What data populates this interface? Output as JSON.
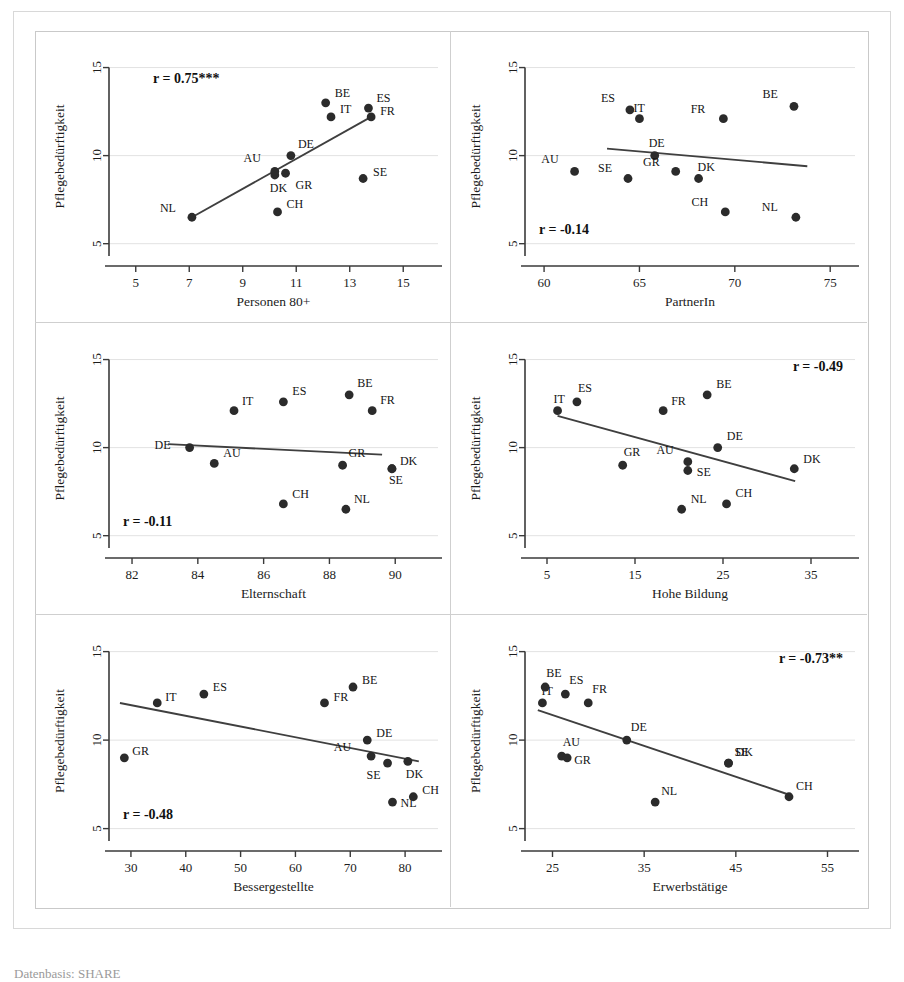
{
  "figure": {
    "y_axis_label": "Pflegebedürftigkeit",
    "y_ticks": [
      "5",
      "10",
      "15"
    ],
    "caption": "Datenbasis: SHARE"
  },
  "chart_data": [
    {
      "type": "scatter",
      "panel": 1,
      "title": "",
      "xlabel": "Personen 80+",
      "ylabel": "Pflegebedürftigkeit",
      "annotation": "r = 0.75***",
      "correlation": 0.75,
      "significance": "***",
      "xlim": [
        4.0,
        16.3
      ],
      "ylim": [
        4.3,
        15.6
      ],
      "xticks": [
        5,
        7,
        9,
        11,
        13,
        15
      ],
      "xticklabels": [
        "5",
        "7",
        "9",
        "11",
        "13",
        "15"
      ],
      "yticks": [
        5,
        10,
        15
      ],
      "yticklabels": [
        "5",
        "10",
        "15"
      ],
      "grid": true,
      "legend": "none",
      "points": [
        {
          "label": "NL",
          "x": 7.1,
          "y": 6.5,
          "lx": -16,
          "ly": -5
        },
        {
          "label": "CH",
          "x": 10.3,
          "y": 6.8,
          "lx": 9,
          "ly": -4
        },
        {
          "label": "DK",
          "x": 10.2,
          "y": 8.9,
          "lx": -5,
          "ly": 17
        },
        {
          "label": "AU",
          "x": 10.2,
          "y": 9.1,
          "lx": -14,
          "ly": -9
        },
        {
          "label": "GR",
          "x": 10.6,
          "y": 9.0,
          "lx": 10,
          "ly": 16
        },
        {
          "label": "DE",
          "x": 10.8,
          "y": 10.0,
          "lx": 7,
          "ly": -8
        },
        {
          "label": "SE",
          "x": 13.5,
          "y": 8.7,
          "lx": 10,
          "ly": -3
        },
        {
          "label": "IT",
          "x": 12.3,
          "y": 12.2,
          "lx": 9,
          "ly": -4
        },
        {
          "label": "BE",
          "x": 12.1,
          "y": 13.0,
          "lx": 9,
          "ly": -6
        },
        {
          "label": "ES",
          "x": 13.7,
          "y": 12.7,
          "lx": 8,
          "ly": -6
        },
        {
          "label": "FR",
          "x": 13.8,
          "y": 12.2,
          "lx": 9,
          "ly": -2
        }
      ],
      "fit": {
        "x1": 7.1,
        "y1": 6.5,
        "x2": 13.8,
        "y2": 12.2
      }
    },
    {
      "type": "scatter",
      "panel": 2,
      "title": "",
      "xlabel": "PartnerIn",
      "ylabel": "Pflegebedürftigkeit",
      "annotation": "r = -0.14",
      "correlation": -0.14,
      "significance": "",
      "xlim": [
        59.0,
        76.3
      ],
      "ylim": [
        4.3,
        15.6
      ],
      "xticks": [
        60,
        65,
        70,
        75
      ],
      "xticklabels": [
        "60",
        "65",
        "70",
        "75"
      ],
      "yticks": [
        5,
        10,
        15
      ],
      "yticklabels": [
        "5",
        "10",
        "15"
      ],
      "grid": true,
      "legend": "none",
      "points": [
        {
          "label": "AU",
          "x": 61.6,
          "y": 9.1,
          "lx": -16,
          "ly": -8
        },
        {
          "label": "SE",
          "x": 64.4,
          "y": 8.7,
          "lx": -16,
          "ly": -7
        },
        {
          "label": "ES",
          "x": 64.5,
          "y": 12.6,
          "lx": -15,
          "ly": -8
        },
        {
          "label": "IT",
          "x": 65.0,
          "y": 12.1,
          "lx": -6,
          "ly": -7
        },
        {
          "label": "DE",
          "x": 65.8,
          "y": 10.0,
          "lx": -6,
          "ly": -9
        },
        {
          "label": "GR",
          "x": 66.9,
          "y": 9.1,
          "lx": -16,
          "ly": -5
        },
        {
          "label": "DK",
          "x": 68.1,
          "y": 8.7,
          "lx": -1,
          "ly": -8
        },
        {
          "label": "CH",
          "x": 69.5,
          "y": 6.8,
          "lx": -17,
          "ly": -6
        },
        {
          "label": "FR",
          "x": 69.4,
          "y": 12.1,
          "lx": -18,
          "ly": -6
        },
        {
          "label": "BE",
          "x": 73.1,
          "y": 12.8,
          "lx": -16,
          "ly": -8
        },
        {
          "label": "NL",
          "x": 73.2,
          "y": 6.5,
          "lx": -18,
          "ly": -6
        }
      ],
      "fit": {
        "x1": 63.3,
        "y1": 10.4,
        "x2": 73.8,
        "y2": 9.4
      }
    },
    {
      "type": "scatter",
      "panel": 3,
      "title": "",
      "xlabel": "Elternschaft",
      "ylabel": "Pflegebedürftigkeit",
      "annotation": "r = -0.11",
      "correlation": -0.11,
      "significance": "",
      "xlim": [
        81.3,
        91.3
      ],
      "ylim": [
        4.3,
        15.6
      ],
      "xticks": [
        82,
        84,
        86,
        88,
        90
      ],
      "xticklabels": [
        "82",
        "84",
        "86",
        "88",
        "90"
      ],
      "yticks": [
        5,
        10,
        15
      ],
      "yticklabels": [
        "5",
        "10",
        "15"
      ],
      "grid": true,
      "legend": "none",
      "points": [
        {
          "label": "DE",
          "x": 83.75,
          "y": 10.0,
          "lx": -19,
          "ly": 1
        },
        {
          "label": "AU",
          "x": 84.5,
          "y": 9.1,
          "lx": 9,
          "ly": -6
        },
        {
          "label": "IT",
          "x": 85.1,
          "y": 12.1,
          "lx": 8,
          "ly": -6
        },
        {
          "label": "ES",
          "x": 86.6,
          "y": 12.6,
          "lx": 9,
          "ly": -7
        },
        {
          "label": "CH",
          "x": 86.6,
          "y": 6.8,
          "lx": 9,
          "ly": -6
        },
        {
          "label": "BE",
          "x": 88.6,
          "y": 13.0,
          "lx": 8,
          "ly": -8
        },
        {
          "label": "GR",
          "x": 88.4,
          "y": 9.0,
          "lx": 6,
          "ly": -8
        },
        {
          "label": "NL",
          "x": 88.5,
          "y": 6.5,
          "lx": 8,
          "ly": -6
        },
        {
          "label": "FR",
          "x": 89.3,
          "y": 12.1,
          "lx": 8,
          "ly": -7
        },
        {
          "label": "DK",
          "x": 89.9,
          "y": 8.8,
          "lx": 8,
          "ly": -4
        },
        {
          "label": "SE",
          "x": 89.9,
          "y": 8.8,
          "lx": -3,
          "ly": 15
        }
      ],
      "fit": {
        "x1": 83.1,
        "y1": 10.2,
        "x2": 89.6,
        "y2": 9.6
      }
    },
    {
      "type": "scatter",
      "panel": 4,
      "title": "",
      "xlabel": "Hohe Bildung",
      "ylabel": "Pflegebedürftigkeit",
      "annotation": "r = -0.49",
      "correlation": -0.49,
      "significance": "",
      "xlim": [
        2.5,
        40.0
      ],
      "ylim": [
        4.3,
        15.6
      ],
      "xticks": [
        5,
        15,
        25,
        35
      ],
      "xticklabels": [
        "5",
        "15",
        "25",
        "35"
      ],
      "yticks": [
        5,
        10,
        15
      ],
      "yticklabels": [
        "5",
        "10",
        "15"
      ],
      "grid": true,
      "legend": "none",
      "points": [
        {
          "label": "IT",
          "x": 6.2,
          "y": 12.1,
          "lx": -4,
          "ly": -8
        },
        {
          "label": "ES",
          "x": 8.4,
          "y": 12.6,
          "lx": 1,
          "ly": -10
        },
        {
          "label": "GR",
          "x": 13.6,
          "y": 9.0,
          "lx": 1,
          "ly": -9
        },
        {
          "label": "FR",
          "x": 18.2,
          "y": 12.1,
          "lx": 8,
          "ly": -6
        },
        {
          "label": "AU",
          "x": 21.0,
          "y": 9.2,
          "lx": -14,
          "ly": -8
        },
        {
          "label": "SE",
          "x": 21.0,
          "y": 8.7,
          "lx": 9,
          "ly": 5
        },
        {
          "label": "NL",
          "x": 20.3,
          "y": 6.5,
          "lx": 9,
          "ly": -6
        },
        {
          "label": "BE",
          "x": 23.2,
          "y": 13.0,
          "lx": 9,
          "ly": -7
        },
        {
          "label": "DE",
          "x": 24.4,
          "y": 10.0,
          "lx": 9,
          "ly": -8
        },
        {
          "label": "CH",
          "x": 25.4,
          "y": 6.8,
          "lx": 9,
          "ly": -7
        },
        {
          "label": "DK",
          "x": 33.1,
          "y": 8.8,
          "lx": 9,
          "ly": -6
        }
      ],
      "fit": {
        "x1": 6.2,
        "y1": 11.8,
        "x2": 33.2,
        "y2": 8.1
      }
    },
    {
      "type": "scatter",
      "panel": 5,
      "title": "",
      "xlabel": "Bessergestellte",
      "ylabel": "Pflegebedürftigkeit",
      "annotation": "r = -0.48",
      "correlation": -0.48,
      "significance": "",
      "xlim": [
        26.0,
        86.0
      ],
      "ylim": [
        4.3,
        15.6
      ],
      "xticks": [
        30,
        40,
        50,
        60,
        70,
        80
      ],
      "xticklabels": [
        "30",
        "40",
        "50",
        "60",
        "70",
        "80"
      ],
      "yticks": [
        5,
        10,
        15
      ],
      "yticklabels": [
        "5",
        "10",
        "15"
      ],
      "grid": true,
      "legend": "none",
      "points": [
        {
          "label": "GR",
          "x": 28.8,
          "y": 9.0,
          "lx": 8,
          "ly": -3
        },
        {
          "label": "IT",
          "x": 34.8,
          "y": 12.1,
          "lx": 8,
          "ly": -2
        },
        {
          "label": "ES",
          "x": 43.3,
          "y": 12.6,
          "lx": 9,
          "ly": -3
        },
        {
          "label": "FR",
          "x": 65.3,
          "y": 12.1,
          "lx": 9,
          "ly": -2
        },
        {
          "label": "BE",
          "x": 70.5,
          "y": 13.0,
          "lx": 9,
          "ly": -3
        },
        {
          "label": "DE",
          "x": 73.1,
          "y": 10.0,
          "lx": 9,
          "ly": -3
        },
        {
          "label": "AU",
          "x": 73.8,
          "y": 9.1,
          "lx": -20,
          "ly": -5
        },
        {
          "label": "SE",
          "x": 76.8,
          "y": 8.7,
          "lx": -7,
          "ly": 16
        },
        {
          "label": "DK",
          "x": 80.5,
          "y": 8.8,
          "lx": -2,
          "ly": 17
        },
        {
          "label": "NL",
          "x": 77.7,
          "y": 6.5,
          "lx": 8,
          "ly": 5
        },
        {
          "label": "CH",
          "x": 81.5,
          "y": 6.8,
          "lx": 9,
          "ly": -3
        }
      ],
      "fit": {
        "x1": 28.0,
        "y1": 12.1,
        "x2": 82.5,
        "y2": 8.8
      }
    },
    {
      "type": "scatter",
      "panel": 6,
      "title": "",
      "xlabel": "Erwerbstätige",
      "ylabel": "Pflegebedürftigkeit",
      "annotation": "r = -0.73**",
      "correlation": -0.73,
      "significance": "**",
      "xlim": [
        22.0,
        58.0
      ],
      "ylim": [
        4.3,
        15.6
      ],
      "xticks": [
        25,
        35,
        45,
        55
      ],
      "xticklabels": [
        "25",
        "35",
        "45",
        "55"
      ],
      "yticks": [
        5,
        10,
        15
      ],
      "yticklabels": [
        "5",
        "10",
        "15"
      ],
      "grid": true,
      "legend": "none",
      "points": [
        {
          "label": "IT",
          "x": 23.9,
          "y": 12.1,
          "lx": -1,
          "ly": -8
        },
        {
          "label": "BE",
          "x": 24.2,
          "y": 13.0,
          "lx": 1,
          "ly": -10
        },
        {
          "label": "ES",
          "x": 26.4,
          "y": 12.6,
          "lx": 4,
          "ly": -10
        },
        {
          "label": "FR",
          "x": 28.9,
          "y": 12.1,
          "lx": 4,
          "ly": -10
        },
        {
          "label": "AU",
          "x": 26.0,
          "y": 9.1,
          "lx": 1,
          "ly": -10
        },
        {
          "label": "GR",
          "x": 26.6,
          "y": 9.0,
          "lx": 7,
          "ly": 6
        },
        {
          "label": "DE",
          "x": 33.1,
          "y": 10.0,
          "lx": 4,
          "ly": -9
        },
        {
          "label": "NL",
          "x": 36.2,
          "y": 6.5,
          "lx": 6,
          "ly": -7
        },
        {
          "label": "SE",
          "x": 44.2,
          "y": 8.7,
          "lx": 6,
          "ly": -7
        },
        {
          "label": "DK",
          "x": 44.2,
          "y": 8.7,
          "lx": 7,
          "ly": -7
        },
        {
          "label": "CH",
          "x": 50.8,
          "y": 6.8,
          "lx": 7,
          "ly": -7
        }
      ],
      "fit": {
        "x1": 23.4,
        "y1": 11.7,
        "x2": 50.9,
        "y2": 6.9
      }
    }
  ]
}
